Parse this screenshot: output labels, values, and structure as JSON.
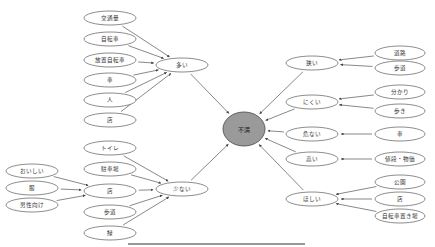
{
  "title": "不満",
  "center": {
    "id": "c",
    "label": "不満",
    "x": 244,
    "y": 129,
    "rx": 21,
    "ry": 17
  },
  "nodes": [
    {
      "id": "ooi",
      "label": "多い",
      "x": 182,
      "y": 65,
      "rx": 26,
      "ry": 7
    },
    {
      "id": "sukunai",
      "label": "少ない",
      "x": 182,
      "y": 189,
      "rx": 26,
      "ry": 7
    },
    {
      "id": "semai",
      "label": "狭い",
      "x": 312,
      "y": 63,
      "rx": 26,
      "ry": 7
    },
    {
      "id": "nikui",
      "label": "にくい",
      "x": 312,
      "y": 102,
      "rx": 26,
      "ry": 7
    },
    {
      "id": "abunai",
      "label": "危ない",
      "x": 312,
      "y": 134,
      "rx": 26,
      "ry": 7
    },
    {
      "id": "takai",
      "label": "高い",
      "x": 312,
      "y": 159,
      "rx": 26,
      "ry": 7
    },
    {
      "id": "hoshii",
      "label": "ほしい",
      "x": 312,
      "y": 199,
      "rx": 26,
      "ry": 7
    },
    {
      "id": "l1",
      "label": "交通量",
      "x": 110,
      "y": 18,
      "rx": 26,
      "ry": 7
    },
    {
      "id": "l2",
      "label": "自転車",
      "x": 110,
      "y": 39,
      "rx": 26,
      "ry": 7
    },
    {
      "id": "l3",
      "label": "放置自転車",
      "x": 110,
      "y": 60,
      "rx": 26,
      "ry": 7
    },
    {
      "id": "l4",
      "label": "車",
      "x": 110,
      "y": 80,
      "rx": 26,
      "ry": 7
    },
    {
      "id": "l5",
      "label": "人",
      "x": 110,
      "y": 100,
      "rx": 26,
      "ry": 7
    },
    {
      "id": "l6",
      "label": "店",
      "x": 110,
      "y": 120,
      "rx": 26,
      "ry": 7
    },
    {
      "id": "m1",
      "label": "トイレ",
      "x": 110,
      "y": 148,
      "rx": 26,
      "ry": 7
    },
    {
      "id": "m2",
      "label": "駐車場",
      "x": 110,
      "y": 169,
      "rx": 26,
      "ry": 7
    },
    {
      "id": "m3",
      "label": "店",
      "x": 110,
      "y": 191,
      "rx": 26,
      "ry": 7
    },
    {
      "id": "m4",
      "label": "歩道",
      "x": 110,
      "y": 212,
      "rx": 26,
      "ry": 7
    },
    {
      "id": "m5",
      "label": "緑",
      "x": 110,
      "y": 233,
      "rx": 26,
      "ry": 7
    },
    {
      "id": "f1",
      "label": "おいしい",
      "x": 32,
      "y": 171,
      "rx": 26,
      "ry": 7
    },
    {
      "id": "f2",
      "label": "服",
      "x": 32,
      "y": 188,
      "rx": 26,
      "ry": 7
    },
    {
      "id": "f3",
      "label": "男性向け",
      "x": 32,
      "y": 205,
      "rx": 26,
      "ry": 7
    },
    {
      "id": "r1",
      "label": "道路",
      "x": 400,
      "y": 53,
      "rx": 25,
      "ry": 7
    },
    {
      "id": "r2",
      "label": "歩道",
      "x": 400,
      "y": 68,
      "rx": 25,
      "ry": 7
    },
    {
      "id": "r3",
      "label": "分かり",
      "x": 400,
      "y": 92,
      "rx": 25,
      "ry": 7
    },
    {
      "id": "r4",
      "label": "歩き",
      "x": 400,
      "y": 111,
      "rx": 25,
      "ry": 7
    },
    {
      "id": "r5",
      "label": "車",
      "x": 400,
      "y": 134,
      "rx": 25,
      "ry": 7
    },
    {
      "id": "r6",
      "label": "値段・物価",
      "x": 400,
      "y": 159,
      "rx": 25,
      "ry": 7
    },
    {
      "id": "r7",
      "label": "公園",
      "x": 400,
      "y": 182,
      "rx": 25,
      "ry": 7
    },
    {
      "id": "r8",
      "label": "店",
      "x": 400,
      "y": 199,
      "rx": 25,
      "ry": 7
    },
    {
      "id": "r9",
      "label": "自転車置き場",
      "x": 400,
      "y": 216,
      "rx": 25,
      "ry": 7
    }
  ],
  "edges": [
    {
      "from": "ooi",
      "to": "c"
    },
    {
      "from": "sukunai",
      "to": "c"
    },
    {
      "from": "semai",
      "to": "c"
    },
    {
      "from": "nikui",
      "to": "c"
    },
    {
      "from": "abunai",
      "to": "c"
    },
    {
      "from": "takai",
      "to": "c"
    },
    {
      "from": "hoshii",
      "to": "c"
    },
    {
      "from": "l1",
      "to": "ooi"
    },
    {
      "from": "l2",
      "to": "ooi"
    },
    {
      "from": "l3",
      "to": "ooi"
    },
    {
      "from": "l4",
      "to": "ooi"
    },
    {
      "from": "l5",
      "to": "ooi"
    },
    {
      "from": "l6",
      "to": "ooi"
    },
    {
      "from": "m1",
      "to": "sukunai"
    },
    {
      "from": "m2",
      "to": "sukunai"
    },
    {
      "from": "m3",
      "to": "sukunai"
    },
    {
      "from": "m4",
      "to": "sukunai"
    },
    {
      "from": "m5",
      "to": "sukunai"
    },
    {
      "from": "f1",
      "to": "m3"
    },
    {
      "from": "f2",
      "to": "m3"
    },
    {
      "from": "f3",
      "to": "m3"
    },
    {
      "from": "r1",
      "to": "semai"
    },
    {
      "from": "r2",
      "to": "semai"
    },
    {
      "from": "r3",
      "to": "nikui"
    },
    {
      "from": "r4",
      "to": "nikui"
    },
    {
      "from": "r5",
      "to": "abunai"
    },
    {
      "from": "r6",
      "to": "takai"
    },
    {
      "from": "r7",
      "to": "hoshii"
    },
    {
      "from": "r8",
      "to": "hoshii"
    },
    {
      "from": "r9",
      "to": "hoshii"
    }
  ],
  "footer_rule": {
    "x1": 128,
    "x2": 305,
    "y": 244
  }
}
